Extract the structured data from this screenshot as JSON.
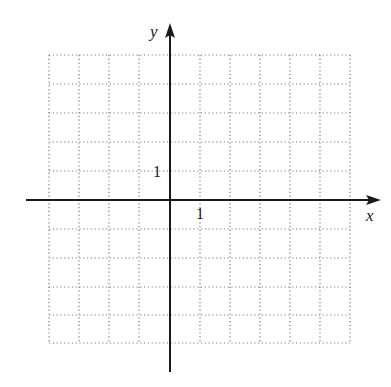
{
  "diagram": {
    "type": "coordinate-grid",
    "x_axis_label": "x",
    "y_axis_label": "y",
    "x_tick_label": "1",
    "y_tick_label": "1",
    "grid": {
      "columns": 10,
      "rows": 10,
      "x_range": [
        -4,
        6
      ],
      "y_range": [
        -5,
        5
      ],
      "line_style": "dotted"
    },
    "colors": {
      "axis": "#1a1a1a",
      "grid": "#7a7a7a",
      "background": "#ffffff"
    }
  }
}
